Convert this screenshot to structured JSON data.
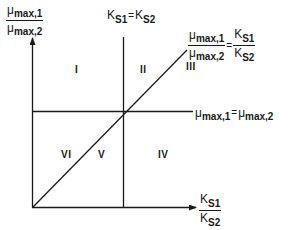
{
  "diagram": {
    "y_axis_label": {
      "numerator": {
        "symbol": "μ",
        "subscript": "max,1"
      },
      "denominator": {
        "symbol": "μ",
        "subscript": "max,2"
      }
    },
    "x_axis_label": {
      "numerator": {
        "symbol": "K",
        "subscript": "S1"
      },
      "denominator": {
        "symbol": "K",
        "subscript": "S2"
      }
    },
    "vertical_line_label": {
      "left": {
        "symbol": "K",
        "subscript": "S1"
      },
      "operator": "=",
      "right": {
        "symbol": "K",
        "subscript": "S2"
      }
    },
    "horizontal_line_label": {
      "left": {
        "symbol": "μ",
        "subscript": "max,1"
      },
      "operator": "=",
      "right": {
        "symbol": "μ",
        "subscript": "max,2"
      }
    },
    "diagonal_label": {
      "left_numerator": {
        "symbol": "μ",
        "subscript": "max,1"
      },
      "left_denominator": {
        "symbol": "μ",
        "subscript": "max,2"
      },
      "operator": "=",
      "right_numerator": {
        "symbol": "K",
        "subscript": "S1"
      },
      "right_denominator": {
        "symbol": "K",
        "subscript": "S2"
      }
    },
    "regions": [
      "I",
      "II",
      "III",
      "IV",
      "V",
      "VI"
    ],
    "line_color": "#1a1a1a",
    "background": "#ffffff"
  }
}
